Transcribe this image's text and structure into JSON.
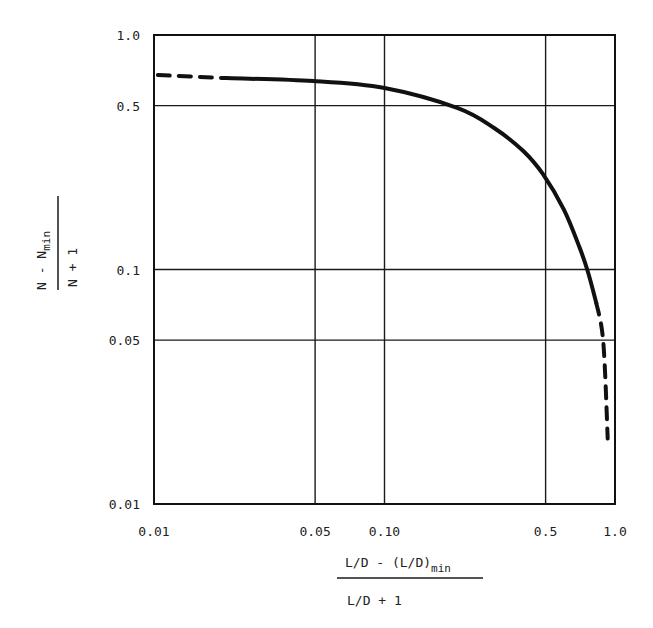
{
  "chart_data": {
    "type": "line",
    "title": "",
    "xlabel": {
      "numerator": "L/D - (L/D)",
      "numerator_subscript": "min",
      "denominator": "L/D + 1",
      "full": "[L/D - (L/D)_min] / (L/D + 1)"
    },
    "ylabel": {
      "numerator": "N - N",
      "numerator_subscript": "min",
      "denominator": "N + 1",
      "full": "(N - N_min) / (N + 1)"
    },
    "xscale": "log",
    "yscale": "log",
    "xlim": [
      0.01,
      1.0
    ],
    "ylim": [
      0.01,
      1.0
    ],
    "x_ticks": [
      {
        "value": 0.01,
        "label": "0.01"
      },
      {
        "value": 0.05,
        "label": "0.05"
      },
      {
        "value": 0.1,
        "label": "0.10"
      },
      {
        "value": 0.5,
        "label": "0.5"
      },
      {
        "value": 1.0,
        "label": "1.0"
      }
    ],
    "y_ticks": [
      {
        "value": 1.0,
        "label": "1.0"
      },
      {
        "value": 0.5,
        "label": "0.5"
      },
      {
        "value": 0.1,
        "label": "0.1"
      },
      {
        "value": 0.05,
        "label": "0.05"
      },
      {
        "value": 0.01,
        "label": "0.01"
      }
    ],
    "grid": true,
    "legend": null,
    "series": [
      {
        "name": "Gilliland correlation (dashed = extrapolated)",
        "segments": [
          {
            "style": "dashed",
            "points": [
              [
                0.0104,
                0.675
              ],
              [
                0.0205,
                0.655
              ]
            ]
          },
          {
            "style": "solid",
            "points": [
              [
                0.0205,
                0.655
              ],
              [
                0.049,
                0.636
              ],
              [
                0.1,
                0.594
              ],
              [
                0.208,
                0.488
              ],
              [
                0.3,
                0.4
              ],
              [
                0.4,
                0.32
              ],
              [
                0.487,
                0.255
              ],
              [
                0.6,
                0.18
              ],
              [
                0.7,
                0.125
              ],
              [
                0.76,
                0.099
              ],
              [
                0.83,
                0.072
              ]
            ]
          },
          {
            "style": "dashed",
            "points": [
              [
                0.83,
                0.072
              ],
              [
                0.89,
                0.049
              ],
              [
                0.93,
                0.019
              ]
            ]
          }
        ]
      }
    ]
  },
  "layout": {
    "plot": {
      "left": 154,
      "top": 35,
      "right": 615,
      "bottom": 504
    },
    "line_color": "#111111",
    "grid_color": "#1a1a1a"
  }
}
